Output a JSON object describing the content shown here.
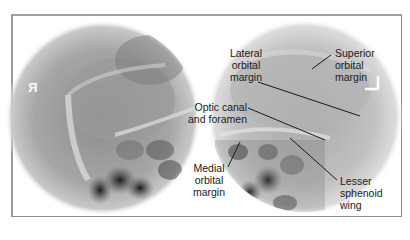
{
  "figure": {
    "views": [
      {
        "id": "right-orbit",
        "marker": "R",
        "marker_note": "mirrored R side marker"
      },
      {
        "id": "left-orbit",
        "marker": "L",
        "marker_note": "L side marker (corner bracket)"
      }
    ],
    "labels": {
      "lateral_orbital_margin": [
        "Lateral",
        "orbital",
        "margin"
      ],
      "superior_orbital_margin": [
        "Superior",
        "orbital",
        "margin"
      ],
      "optic_canal_and_foramen": [
        "Optic canal",
        "and foramen"
      ],
      "medial_orbital_margin": [
        "Medial",
        "orbital",
        "margin"
      ],
      "lesser_sphenoid_wing": [
        "Lesser",
        "sphenoid",
        "wing"
      ]
    },
    "colors": {
      "frame_border": "#8a8a8a",
      "background": "#ffffff",
      "label_text": "#1a1a1a",
      "leader_line": "#1a1a1a"
    }
  }
}
